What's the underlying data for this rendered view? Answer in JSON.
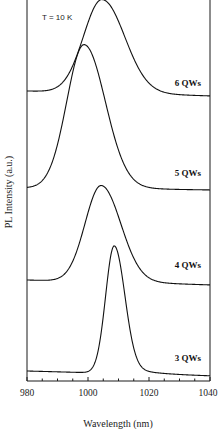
{
  "chart_data": {
    "type": "line",
    "title": "",
    "annotation": "T = 10 K",
    "xlabel": "Wavelength (nm)",
    "ylabel": "PL Intensity (a.u.)",
    "xlim": [
      980,
      1040
    ],
    "x_ticks": [
      980,
      1000,
      1020,
      1040
    ],
    "x_minor_step": 5,
    "ylim": "arbitrary units, curves vertically offset",
    "grid": false,
    "legend": "inline labels at right of each curve",
    "series": [
      {
        "name": "6 QWs",
        "label": "6 QWs",
        "peak_nm": 1004.6,
        "fwhm_nm": 15,
        "baseline_left_px": 91,
        "baseline_right_px": 96,
        "peak_px": 0,
        "label_y_px": 86
      },
      {
        "name": "5 QWs",
        "label": "5 QWs",
        "peak_nm": 998.7,
        "fwhm_nm": 14,
        "baseline_left_px": 188,
        "baseline_right_px": 190,
        "peak_px": 45,
        "label_y_px": 176
      },
      {
        "name": "4 QWs",
        "label": "4 QWs",
        "peak_nm": 1004.3,
        "fwhm_nm": 13,
        "baseline_left_px": 280,
        "baseline_right_px": 285,
        "peak_px": 186,
        "label_y_px": 268
      },
      {
        "name": "3 QWs",
        "label": "3 QWs",
        "peak_nm": 1008.6,
        "fwhm_nm": 7,
        "baseline_left_px": 371,
        "baseline_right_px": 376,
        "peak_px": 246,
        "label_y_px": 361
      }
    ]
  },
  "labels": {
    "annotation": "T = 10 K",
    "xlabel": "Wavelength (nm)",
    "ylabel": "PL Intensity (a.u.)",
    "tick_980": "980",
    "tick_1000": "1000",
    "tick_1020": "1020",
    "tick_1040": "1040",
    "s6": "6 QWs",
    "s5": "5 QWs",
    "s4": "4 QWs",
    "s3": "3 QWs"
  }
}
